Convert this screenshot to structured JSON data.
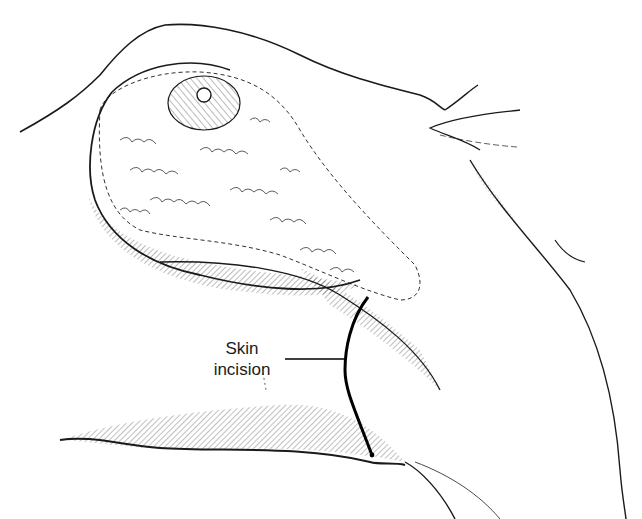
{
  "figure": {
    "labels": {
      "incision_line1": "Skin",
      "incision_line2": "incision"
    },
    "colors": {
      "ink": "#1a1a1a",
      "background": "#ffffff"
    }
  }
}
